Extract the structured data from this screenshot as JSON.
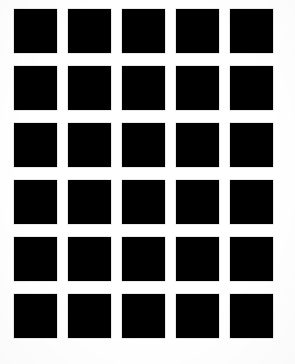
{
  "figure": {
    "type": "grid-illusion",
    "canvas": {
      "width": 295,
      "height": 364,
      "background_color": "#ffffff"
    },
    "grid": {
      "columns": 5,
      "rows": 6,
      "total_cells": 30,
      "cell_color": "#000000",
      "gap_color": "#ffffff",
      "cell_width": 43,
      "cell_height": 44,
      "column_pitch": 54,
      "row_pitch": 57,
      "column_gap": 11,
      "row_gap": 13,
      "origin_x": 14,
      "origin_y": 9,
      "column_x": [
        14,
        68,
        122,
        176,
        230
      ],
      "row_y": [
        9,
        66,
        123,
        180,
        237,
        294
      ]
    },
    "cells": [
      {
        "row": 0,
        "col": 0,
        "x": 14,
        "y": 9,
        "w": 43,
        "h": 44
      },
      {
        "row": 0,
        "col": 1,
        "x": 68,
        "y": 9,
        "w": 43,
        "h": 44
      },
      {
        "row": 0,
        "col": 2,
        "x": 122,
        "y": 9,
        "w": 43,
        "h": 44
      },
      {
        "row": 0,
        "col": 3,
        "x": 176,
        "y": 9,
        "w": 43,
        "h": 44
      },
      {
        "row": 0,
        "col": 4,
        "x": 230,
        "y": 9,
        "w": 43,
        "h": 44
      },
      {
        "row": 1,
        "col": 0,
        "x": 14,
        "y": 66,
        "w": 43,
        "h": 44
      },
      {
        "row": 1,
        "col": 1,
        "x": 68,
        "y": 66,
        "w": 43,
        "h": 44
      },
      {
        "row": 1,
        "col": 2,
        "x": 122,
        "y": 66,
        "w": 43,
        "h": 44
      },
      {
        "row": 1,
        "col": 3,
        "x": 176,
        "y": 66,
        "w": 43,
        "h": 44
      },
      {
        "row": 1,
        "col": 4,
        "x": 230,
        "y": 66,
        "w": 43,
        "h": 44
      },
      {
        "row": 2,
        "col": 0,
        "x": 14,
        "y": 123,
        "w": 43,
        "h": 44
      },
      {
        "row": 2,
        "col": 1,
        "x": 68,
        "y": 123,
        "w": 43,
        "h": 44
      },
      {
        "row": 2,
        "col": 2,
        "x": 122,
        "y": 123,
        "w": 43,
        "h": 44
      },
      {
        "row": 2,
        "col": 3,
        "x": 176,
        "y": 123,
        "w": 43,
        "h": 44
      },
      {
        "row": 2,
        "col": 4,
        "x": 230,
        "y": 123,
        "w": 43,
        "h": 44
      },
      {
        "row": 3,
        "col": 0,
        "x": 14,
        "y": 180,
        "w": 43,
        "h": 44
      },
      {
        "row": 3,
        "col": 1,
        "x": 68,
        "y": 180,
        "w": 43,
        "h": 44
      },
      {
        "row": 3,
        "col": 2,
        "x": 122,
        "y": 180,
        "w": 43,
        "h": 44
      },
      {
        "row": 3,
        "col": 3,
        "x": 176,
        "y": 180,
        "w": 43,
        "h": 44
      },
      {
        "row": 3,
        "col": 4,
        "x": 230,
        "y": 180,
        "w": 43,
        "h": 44
      },
      {
        "row": 4,
        "col": 0,
        "x": 14,
        "y": 237,
        "w": 43,
        "h": 44
      },
      {
        "row": 4,
        "col": 1,
        "x": 68,
        "y": 237,
        "w": 43,
        "h": 44
      },
      {
        "row": 4,
        "col": 2,
        "x": 122,
        "y": 237,
        "w": 43,
        "h": 44
      },
      {
        "row": 4,
        "col": 3,
        "x": 176,
        "y": 237,
        "w": 43,
        "h": 44
      },
      {
        "row": 4,
        "col": 4,
        "x": 230,
        "y": 237,
        "w": 43,
        "h": 44
      },
      {
        "row": 5,
        "col": 0,
        "x": 14,
        "y": 294,
        "w": 43,
        "h": 44
      },
      {
        "row": 5,
        "col": 1,
        "x": 68,
        "y": 294,
        "w": 43,
        "h": 44
      },
      {
        "row": 5,
        "col": 2,
        "x": 122,
        "y": 294,
        "w": 43,
        "h": 44
      },
      {
        "row": 5,
        "col": 3,
        "x": 176,
        "y": 294,
        "w": 43,
        "h": 44
      },
      {
        "row": 5,
        "col": 4,
        "x": 230,
        "y": 294,
        "w": 43,
        "h": 44
      }
    ]
  }
}
